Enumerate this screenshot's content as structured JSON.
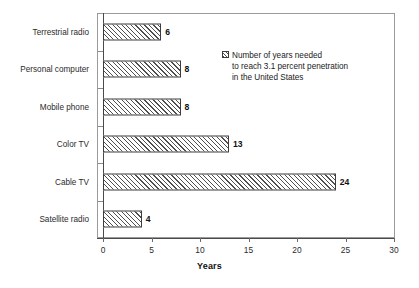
{
  "chart_data": {
    "type": "bar",
    "orientation": "horizontal",
    "title": "",
    "xlabel": "Years",
    "ylabel": "",
    "xlim": [
      0,
      30
    ],
    "xticks": [
      "0",
      "5",
      "10",
      "15",
      "20",
      "25",
      "30"
    ],
    "grid": false,
    "legend_position": "inside-top-right",
    "categories": [
      "Terrestrial radio",
      "Personal computer",
      "Mobile phone",
      "Color TV",
      "Cable TV",
      "Satellite radio"
    ],
    "values": [
      6,
      8,
      8,
      13,
      24,
      4
    ],
    "value_labels": [
      "6",
      "8",
      "8",
      "13",
      "24",
      "4"
    ],
    "series": [
      {
        "name": "Number of years needed to reach 3.1 percent penetration in the United States",
        "values": [
          6,
          8,
          8,
          13,
          24,
          4
        ]
      }
    ],
    "legend": [
      {
        "swatch": "hatched-square",
        "label": "Number of years needed\nto reach 3.1 percent penetration\nin the United States"
      }
    ]
  },
  "axis": {
    "x_title": "Years"
  }
}
